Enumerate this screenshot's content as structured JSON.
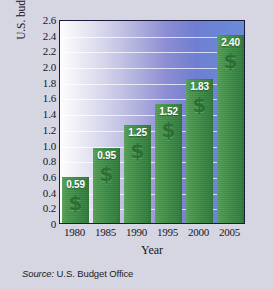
{
  "chart_data": {
    "type": "bar",
    "title": "",
    "xlabel": "Year",
    "ylabel": "U.S. budget (in trillions of dollars)",
    "categories": [
      "1980",
      "1985",
      "1990",
      "1995",
      "2000",
      "2005"
    ],
    "values": [
      0.59,
      0.95,
      1.25,
      1.52,
      1.83,
      2.4
    ],
    "value_labels": [
      "0.59",
      "0.95",
      "1.25",
      "1.52",
      "1.83",
      "2.40"
    ],
    "ylim": [
      0,
      2.6
    ],
    "ytick_step": 0.2,
    "ytick_labels": [
      "2.6",
      "2.4",
      "2.2",
      "2.0",
      "1.8",
      "1.6",
      "1.4",
      "1.2",
      "1.0",
      "0.8",
      "0.6",
      "0.4",
      "0.2",
      "0"
    ],
    "ytick_values": [
      2.6,
      2.4,
      2.2,
      2.0,
      1.8,
      1.6,
      1.4,
      1.2,
      1.0,
      0.8,
      0.6,
      0.4,
      0.2,
      0
    ],
    "grid": true,
    "grid_color": "#ffffff",
    "legend": false,
    "bar_color": "#3d8c46",
    "bar_symbol": "$",
    "plot_background": "gradient-white-to-blue",
    "plot_border_color": "#1a1a3c",
    "figure_background": "#d6d6e3"
  },
  "source": {
    "prefix": "Source:",
    "value": "U.S. Budget Office"
  }
}
